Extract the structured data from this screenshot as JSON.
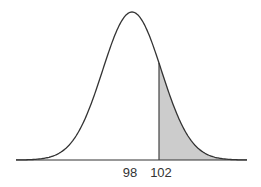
{
  "chart_data": {
    "type": "area",
    "title": "",
    "subtitle": "",
    "xlabel": "",
    "ylabel": "",
    "distribution": "normal",
    "mean": 98,
    "sd": 4.35,
    "shaded_region": {
      "from": 102,
      "to": "inf",
      "side": "right"
    },
    "tick_labels": [
      "98",
      "102"
    ],
    "tick_values": [
      98,
      102
    ],
    "grid": false,
    "legend": null,
    "colors": {
      "curve": "#333333",
      "shade": "#cccccc",
      "axis": "#333333"
    }
  },
  "labels": {
    "mean": "98",
    "cutoff": "102"
  }
}
